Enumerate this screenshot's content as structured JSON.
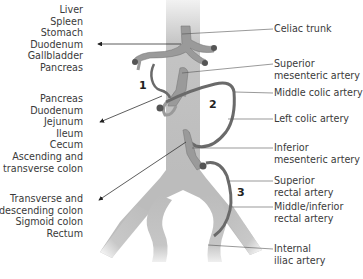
{
  "left_groups": [
    {
      "id": "foregut",
      "items": [
        "Liver",
        "Spleen",
        "Stomach",
        "Duodenum",
        "Gallbladder",
        "Pancreas"
      ]
    },
    {
      "id": "midgut",
      "items": [
        "Pancreas",
        "Duodenum",
        "Jejunum",
        "Ileum",
        "Cecum",
        "Ascending and",
        "transverse colon"
      ]
    },
    {
      "id": "hindgut",
      "items": [
        "Transverse and",
        "descending colon",
        "Sigmoid colon",
        "Rectum"
      ]
    }
  ],
  "right_labels": [
    {
      "id": "celiac",
      "lines": [
        "Celiac trunk"
      ]
    },
    {
      "id": "sma",
      "lines": [
        "Superior",
        "mesenteric artery"
      ]
    },
    {
      "id": "middle-colic",
      "lines": [
        "Middle colic artery"
      ]
    },
    {
      "id": "left-colic",
      "lines": [
        "Left colic artery"
      ]
    },
    {
      "id": "ima",
      "lines": [
        "Inferior",
        "mesenteric artery"
      ]
    },
    {
      "id": "superior-rectal",
      "lines": [
        "Superior",
        "rectal artery"
      ]
    },
    {
      "id": "middle-inferior-rectal",
      "lines": [
        "Middle/inferior",
        "rectal artery"
      ]
    },
    {
      "id": "internal-iliac",
      "lines": [
        "Internal",
        "iliac artery"
      ]
    }
  ],
  "anastomosis_numbers": [
    "1",
    "2",
    "3"
  ],
  "colors": {
    "aorta": "#b9b9b9",
    "aorta_light": "#e6e6e6",
    "artery": "#8f8f8f",
    "anastomosis": "#6a6a6a",
    "leader": "#555555",
    "text": "#3a3a3a"
  }
}
